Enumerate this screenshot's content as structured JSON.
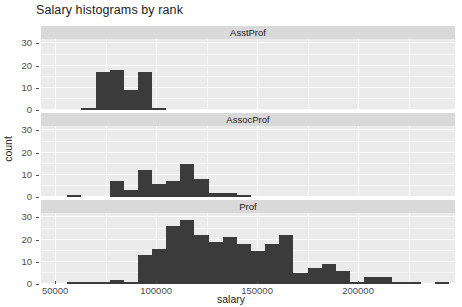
{
  "chart_data": {
    "type": "bar",
    "title": "Salary histograms by rank",
    "xlabel": "salary",
    "ylabel": "count",
    "xlim": [
      43000,
      248000
    ],
    "ylim": [
      0,
      32
    ],
    "grid": true,
    "legend_position": "none",
    "facet_variable": "rank",
    "bin_width": 7000,
    "x_ticks": [
      "50000",
      "100000",
      "150000",
      "200000"
    ],
    "x_tick_values": [
      50000,
      100000,
      150000,
      200000
    ],
    "y_ticks": [
      "0",
      "10",
      "20",
      "30"
    ],
    "y_tick_values": [
      0,
      10,
      20,
      30
    ],
    "panels": [
      {
        "label": "AsstProf",
        "bins": [
          {
            "x0": 63000,
            "x1": 70000,
            "count": 1
          },
          {
            "x0": 70000,
            "x1": 77000,
            "count": 17
          },
          {
            "x0": 77000,
            "x1": 84000,
            "count": 18
          },
          {
            "x0": 84000,
            "x1": 91000,
            "count": 9
          },
          {
            "x0": 91000,
            "x1": 98000,
            "count": 17
          },
          {
            "x0": 98000,
            "x1": 105000,
            "count": 1
          }
        ]
      },
      {
        "label": "AssocProf",
        "bins": [
          {
            "x0": 56000,
            "x1": 63000,
            "count": 1
          },
          {
            "x0": 77000,
            "x1": 84000,
            "count": 7
          },
          {
            "x0": 84000,
            "x1": 91000,
            "count": 3
          },
          {
            "x0": 91000,
            "x1": 98000,
            "count": 12
          },
          {
            "x0": 98000,
            "x1": 105000,
            "count": 6
          },
          {
            "x0": 105000,
            "x1": 112000,
            "count": 7
          },
          {
            "x0": 112000,
            "x1": 119000,
            "count": 15
          },
          {
            "x0": 119000,
            "x1": 126000,
            "count": 8
          },
          {
            "x0": 126000,
            "x1": 133000,
            "count": 2
          },
          {
            "x0": 133000,
            "x1": 140000,
            "count": 2
          },
          {
            "x0": 140000,
            "x1": 147000,
            "count": 1
          }
        ]
      },
      {
        "label": "Prof",
        "bins": [
          {
            "x0": 56000,
            "x1": 63000,
            "count": 1
          },
          {
            "x0": 63000,
            "x1": 70000,
            "count": 1
          },
          {
            "x0": 70000,
            "x1": 77000,
            "count": 1
          },
          {
            "x0": 77000,
            "x1": 84000,
            "count": 2
          },
          {
            "x0": 84000,
            "x1": 91000,
            "count": 1
          },
          {
            "x0": 91000,
            "x1": 98000,
            "count": 13
          },
          {
            "x0": 98000,
            "x1": 105000,
            "count": 16
          },
          {
            "x0": 105000,
            "x1": 112000,
            "count": 26
          },
          {
            "x0": 112000,
            "x1": 119000,
            "count": 29
          },
          {
            "x0": 119000,
            "x1": 126000,
            "count": 22
          },
          {
            "x0": 126000,
            "x1": 133000,
            "count": 19
          },
          {
            "x0": 133000,
            "x1": 140000,
            "count": 21
          },
          {
            "x0": 140000,
            "x1": 147000,
            "count": 18
          },
          {
            "x0": 147000,
            "x1": 154000,
            "count": 15
          },
          {
            "x0": 154000,
            "x1": 161000,
            "count": 18
          },
          {
            "x0": 161000,
            "x1": 168000,
            "count": 22
          },
          {
            "x0": 168000,
            "x1": 175000,
            "count": 5
          },
          {
            "x0": 175000,
            "x1": 182000,
            "count": 7
          },
          {
            "x0": 182000,
            "x1": 189000,
            "count": 9
          },
          {
            "x0": 189000,
            "x1": 196000,
            "count": 6
          },
          {
            "x0": 196000,
            "x1": 203000,
            "count": 1
          },
          {
            "x0": 203000,
            "x1": 210000,
            "count": 3
          },
          {
            "x0": 210000,
            "x1": 217000,
            "count": 3
          },
          {
            "x0": 217000,
            "x1": 224000,
            "count": 1
          },
          {
            "x0": 224000,
            "x1": 231000,
            "count": 1
          },
          {
            "x0": 238000,
            "x1": 245000,
            "count": 1
          }
        ]
      }
    ]
  },
  "style": {
    "panel_background": "#ebebeb",
    "strip_background": "#d9d9d9",
    "bar_color": "#3b3b3b",
    "grid_color": "#ffffff",
    "text_color": "#1c1c1c",
    "axis_text_color": "#4d4d4d"
  }
}
